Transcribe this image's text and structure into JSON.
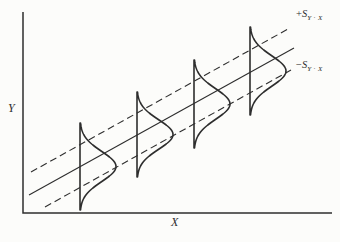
{
  "figure": {
    "background_color": "#fcfcfa",
    "ink_color": "#2e2e2e",
    "axis": {
      "x_label": "X",
      "y_label": "Y"
    },
    "band_labels": {
      "upper": {
        "sign": "+",
        "symbol": "S",
        "subscript": "Y · X"
      },
      "lower": {
        "sign": "−",
        "symbol": "S",
        "subscript": "Y · X"
      }
    }
  },
  "chart_data": {
    "type": "line",
    "title": "",
    "canvas": {
      "width": 340,
      "height": 242
    },
    "axes": {
      "y_axis": {
        "x": 23,
        "y_top": 12,
        "y_bottom": 213
      },
      "x_axis": {
        "y": 213,
        "x_left": 23,
        "x_right": 332
      },
      "x_label": "X",
      "y_label": "Y",
      "ticks": "none",
      "grid": false
    },
    "lines": [
      {
        "name": "regression-line",
        "x1": 29,
        "y1": 195,
        "x2": 294,
        "y2": 48,
        "dashed": false,
        "label": ""
      },
      {
        "name": "upper-error-band",
        "x1": 31,
        "y1": 172,
        "x2": 288,
        "y2": 29,
        "dashed": true,
        "label": "+S Y·X"
      },
      {
        "name": "lower-error-band",
        "x1": 45,
        "y1": 207,
        "x2": 291,
        "y2": 70,
        "dashed": true,
        "label": "−S Y·X"
      }
    ],
    "distributions": [
      {
        "baseline_x": 80,
        "center_y": 166.5,
        "half_height": 43.5,
        "peak": 36
      },
      {
        "baseline_x": 137,
        "center_y": 134.5,
        "half_height": 42.5,
        "peak": 36
      },
      {
        "baseline_x": 194,
        "center_y": 104,
        "half_height": 44,
        "peak": 36
      },
      {
        "baseline_x": 250,
        "center_y": 71,
        "half_height": 44,
        "peak": 36
      }
    ],
    "stroke": {
      "axis_width": 1.5,
      "line_width": 1.1,
      "curve_width": 1.6,
      "dash": "7 4",
      "sigma_ratio": 2.9
    }
  }
}
